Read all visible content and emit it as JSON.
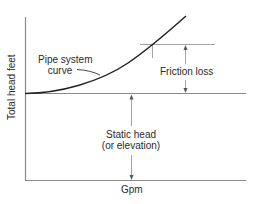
{
  "diagram": {
    "axes": {
      "xlabel": "Gpm",
      "ylabel": "Total head feet"
    },
    "labels": {
      "curve_line1": "Pipe system",
      "curve_line2": "curve",
      "friction": "Friction loss",
      "static_line1": "Static head",
      "static_line2": "(or elevation)"
    },
    "colors": {
      "axis": "#8a8a8a",
      "curve": "#222222",
      "guide": "#9a9a9a",
      "text": "#2a2a2a"
    }
  }
}
